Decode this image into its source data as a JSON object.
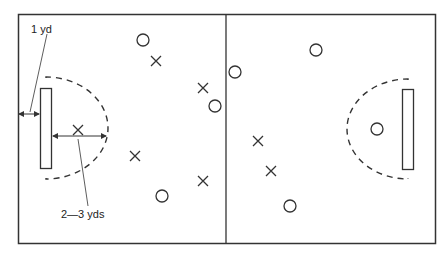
{
  "labels": {
    "goal_distance": "1 yd",
    "circle_radius": "2—3 yds"
  },
  "colors": {
    "line": "#333333",
    "background": "#ffffff"
  },
  "field": {
    "left": 18,
    "top": 14,
    "right": 435,
    "bottom": 243,
    "midline_x": 226
  },
  "players_o": [
    {
      "x": 143,
      "y": 40
    },
    {
      "x": 215,
      "y": 106
    },
    {
      "x": 162,
      "y": 196
    },
    {
      "x": 235,
      "y": 72
    },
    {
      "x": 316,
      "y": 50
    },
    {
      "x": 377,
      "y": 129
    },
    {
      "x": 290,
      "y": 206
    }
  ],
  "players_x": [
    {
      "x": 156,
      "y": 61
    },
    {
      "x": 203,
      "y": 88
    },
    {
      "x": 78,
      "y": 130
    },
    {
      "x": 135,
      "y": 156
    },
    {
      "x": 203,
      "y": 181
    },
    {
      "x": 258,
      "y": 141
    },
    {
      "x": 271,
      "y": 171
    }
  ]
}
